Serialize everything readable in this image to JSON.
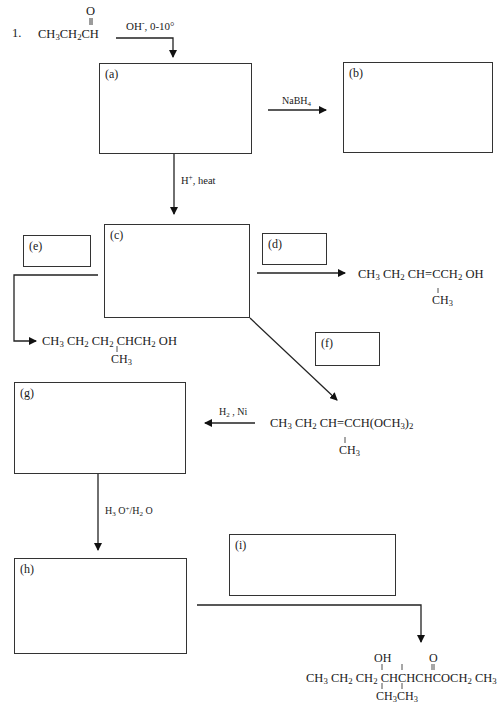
{
  "problem": {
    "number": "1.",
    "starting_material": {
      "carbonyl_o": "O",
      "formula_parts": [
        "CH",
        "3",
        "CH",
        "2",
        "CH"
      ]
    },
    "first_condition": {
      "base": "OH",
      "charge": "-",
      "rest": ", 0-10°"
    }
  },
  "boxes": [
    {
      "id": "a",
      "label": "(a)"
    },
    {
      "id": "b",
      "label": "(b)"
    },
    {
      "id": "c",
      "label": "(c)"
    },
    {
      "id": "d",
      "label": "(d)"
    },
    {
      "id": "e",
      "label": "(e)"
    },
    {
      "id": "f",
      "label": "(f)"
    },
    {
      "id": "g",
      "label": "(g)"
    },
    {
      "id": "h",
      "label": "(h)"
    },
    {
      "id": "i",
      "label": "(i)"
    }
  ],
  "reagents": {
    "a_to_b": {
      "main": "NaBH",
      "sub": "4"
    },
    "a_to_c": {
      "main": "H",
      "sup": "+",
      "rest": ", heat"
    },
    "acetal_to_g": {
      "main": "H",
      "sub": "2",
      "rest": " , Ni"
    },
    "g_to_h": {
      "p1": "H",
      "s1": "3",
      "p2": " O",
      "sup": "+",
      "p3": "/H",
      "s2": "2",
      "p4": " O"
    }
  },
  "products": {
    "from_d": {
      "main": [
        "CH",
        "3",
        " CH",
        "2",
        " CH=CCH",
        "2",
        " OH"
      ],
      "branch": [
        "CH",
        "3"
      ]
    },
    "from_e": {
      "main": [
        "CH",
        "3",
        " CH",
        "2",
        " CH",
        "2",
        " CHCH",
        "2",
        " OH"
      ],
      "branch": [
        "CH",
        "3"
      ]
    },
    "acetal": {
      "main": [
        "CH",
        "3",
        " CH",
        "2",
        " CH=CCH(OCH",
        "3",
        ")",
        "2"
      ],
      "branch": [
        "CH",
        "3"
      ]
    },
    "final_ester": {
      "top_oh": "OH",
      "top_o": "O",
      "main": [
        "CH",
        "3",
        " CH",
        "2",
        " CH",
        "2",
        " CHCHCHCOCH",
        "2",
        " CH",
        "3"
      ],
      "branch1": [
        "CH",
        "3"
      ],
      "branch2": [
        "CH",
        "3"
      ]
    }
  }
}
